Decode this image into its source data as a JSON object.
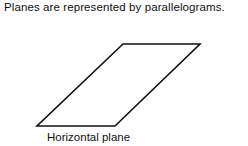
{
  "caption": "Planes are represented by parallelograms.",
  "figure": {
    "shape": "parallelogram",
    "label": "Horizontal plane",
    "stroke_color": "#111111",
    "vertices": [
      [
        37,
        126
      ],
      [
        115,
        126
      ],
      [
        200,
        44
      ],
      [
        123,
        44
      ]
    ]
  }
}
